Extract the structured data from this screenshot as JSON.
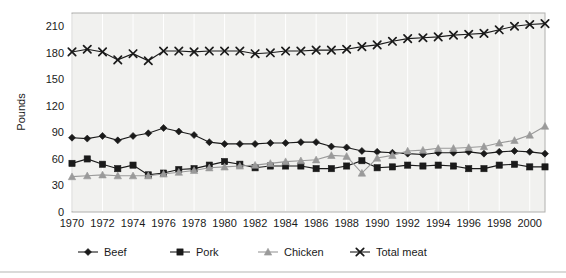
{
  "chart_data": {
    "type": "line",
    "title": "",
    "xlabel": "",
    "ylabel": "Pounds",
    "xlim": [
      1970,
      2001
    ],
    "ylim": [
      0,
      225
    ],
    "yticks": [
      0,
      30,
      60,
      90,
      120,
      150,
      180,
      210
    ],
    "ytick_labels": [
      "0",
      "30",
      "60",
      "90",
      "120",
      "150",
      "180",
      "210"
    ],
    "xticks": [
      1970,
      1972,
      1974,
      1976,
      1978,
      1980,
      1982,
      1984,
      1986,
      1988,
      1990,
      1992,
      1994,
      1996,
      1998,
      2000
    ],
    "xtick_labels": [
      "1970",
      "1972",
      "1974",
      "1976",
      "1978",
      "1980",
      "1982",
      "1984",
      "1986",
      "1988",
      "1990",
      "1992",
      "1994",
      "1996",
      "1998",
      "2000"
    ],
    "x": [
      1970,
      1971,
      1972,
      1973,
      1974,
      1975,
      1976,
      1977,
      1978,
      1979,
      1980,
      1981,
      1982,
      1983,
      1984,
      1985,
      1986,
      1987,
      1988,
      1989,
      1990,
      1991,
      1992,
      1993,
      1994,
      1995,
      1996,
      1997,
      1998,
      1999,
      2000,
      2001
    ],
    "grid": "vertical-only",
    "legend_position": "below-axis",
    "plot_background": "#f1f1ef",
    "series": [
      {
        "name": "Beef",
        "marker": "diamond",
        "color": "#1a1a1a",
        "values": [
          84,
          83,
          86,
          81,
          86,
          89,
          95,
          91,
          87,
          79,
          77,
          77,
          77,
          78,
          78,
          79,
          79,
          74,
          73,
          69,
          68,
          67,
          66,
          65,
          67,
          67,
          68,
          66,
          68,
          69,
          68,
          66
        ]
      },
      {
        "name": "Pork",
        "marker": "square",
        "color": "#1a1a1a",
        "values": [
          55,
          60,
          54,
          49,
          53,
          42,
          44,
          48,
          49,
          53,
          57,
          54,
          50,
          52,
          52,
          52,
          49,
          49,
          52,
          58,
          50,
          51,
          53,
          52,
          53,
          52,
          49,
          49,
          53,
          54,
          51,
          51
        ]
      },
      {
        "name": "Chicken",
        "marker": "triangle",
        "color": "#9a9a9a",
        "values": [
          40,
          41,
          42,
          41,
          41,
          41,
          43,
          45,
          47,
          50,
          51,
          52,
          53,
          55,
          57,
          58,
          59,
          64,
          63,
          44,
          61,
          64,
          69,
          70,
          72,
          72,
          73,
          74,
          78,
          81,
          87,
          97
        ]
      },
      {
        "name": "Total meat",
        "marker": "x",
        "color": "#1a1a1a",
        "values": [
          181,
          184,
          181,
          172,
          179,
          171,
          182,
          182,
          181,
          182,
          182,
          182,
          179,
          180,
          182,
          182,
          183,
          183,
          184,
          187,
          189,
          193,
          196,
          197,
          198,
          200,
          201,
          202,
          206,
          210,
          212,
          213
        ]
      }
    ]
  },
  "legend": {
    "items": [
      {
        "label": "Beef",
        "marker": "diamond",
        "color": "#1a1a1a"
      },
      {
        "label": "Pork",
        "marker": "square",
        "color": "#1a1a1a"
      },
      {
        "label": "Chicken",
        "marker": "triangle",
        "color": "#9a9a9a"
      },
      {
        "label": "Total meat",
        "marker": "x",
        "color": "#1a1a1a"
      }
    ]
  },
  "axes": {
    "y_title": "Pounds"
  }
}
